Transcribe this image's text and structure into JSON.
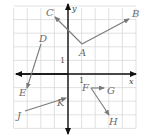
{
  "diagram": {
    "title": "",
    "grid": {
      "origin_px": [
        68,
        74
      ],
      "unit_px": 13.6,
      "x_range": [
        -4,
        5
      ],
      "y_range": [
        -4,
        5
      ],
      "line_color": "#d9d9d9"
    },
    "axes": {
      "x_label": "x",
      "y_label": "y",
      "x_tick_label": "1",
      "y_tick_label": "1",
      "color": "#111111"
    },
    "vector_color": "#7a7a7a",
    "vectors": [
      {
        "name": "AB",
        "from": "A",
        "to": "B"
      },
      {
        "name": "AC",
        "from": "A",
        "to": "C"
      },
      {
        "name": "DE",
        "from": "D",
        "to": "E"
      },
      {
        "name": "JK",
        "from": "J",
        "to": "K"
      },
      {
        "name": "FG",
        "from": "F",
        "to": "G"
      },
      {
        "name": "FH",
        "from": "F",
        "to": "H"
      }
    ],
    "points": {
      "A": {
        "label": "A",
        "px": [
          82,
          44
        ]
      },
      "B": {
        "label": "B",
        "px": [
          129,
          19
        ]
      },
      "C": {
        "label": "C",
        "px": [
          55,
          17
        ]
      },
      "D": {
        "label": "D",
        "px": [
          41,
          44
        ]
      },
      "E": {
        "label": "E",
        "px": [
          27,
          88
        ]
      },
      "J": {
        "label": "J",
        "px": [
          25,
          111
        ]
      },
      "K": {
        "label": "K",
        "px": [
          66,
          98
        ]
      },
      "F": {
        "label": "F",
        "px": [
          91,
          88
        ]
      },
      "G": {
        "label": "G",
        "px": [
          104,
          88
        ]
      },
      "H": {
        "label": "H",
        "px": [
          109,
          115
        ]
      }
    }
  }
}
